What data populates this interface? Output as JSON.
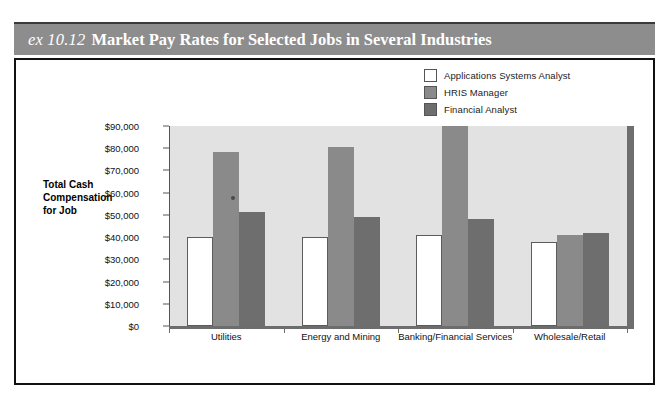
{
  "exhibit": {
    "number": "ex 10.12",
    "title": "Market Pay Rates for Selected Jobs in Several Industries",
    "header_color": "#8d8d8d"
  },
  "chart_data": {
    "type": "bar",
    "title": "Market Pay Rates for Selected Jobs in Several Industries",
    "xlabel": "",
    "ylabel": "Total Cash Compensation for Job",
    "ylim": [
      0,
      90000
    ],
    "ytick_values": [
      0,
      10000,
      20000,
      30000,
      40000,
      50000,
      60000,
      70000,
      80000,
      90000
    ],
    "ytick_labels": [
      "$0",
      "$10,000",
      "$20,000",
      "$30,000",
      "$40,000",
      "$50,000",
      "$60,000",
      "$70,000",
      "$80,000",
      "$90,000"
    ],
    "categories": [
      "Utilities",
      "Energy and Mining",
      "Banking/Financial Services",
      "Wholesale/Retail"
    ],
    "grid": false,
    "legend_position": "top-right",
    "series": [
      {
        "name": "Applications Systems Analyst",
        "color": "#ffffff",
        "values": [
          40000,
          40000,
          41000,
          38000
        ]
      },
      {
        "name": "HRIS Manager",
        "color": "#8a8a8a",
        "values": [
          78500,
          80500,
          90000,
          41000
        ]
      },
      {
        "name": "Financial Analyst",
        "color": "#6e6e6e",
        "values": [
          51500,
          49000,
          48000,
          42000
        ]
      }
    ]
  }
}
